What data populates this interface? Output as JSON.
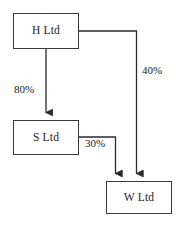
{
  "diagram": {
    "type": "flow-diagram",
    "colors": {
      "background": "#fefefe",
      "node_fill": "#ffffff",
      "node_border": "#3a3a3a",
      "edge": "#2b2b2b",
      "text": "#1c1c1c"
    },
    "nodes": [
      {
        "id": "h",
        "label": "H Ltd"
      },
      {
        "id": "s",
        "label": "S Ltd"
      },
      {
        "id": "w",
        "label": "W Ltd"
      }
    ],
    "edges": [
      {
        "id": "h-s",
        "from": "H Ltd",
        "to": "S Ltd",
        "label": "80%",
        "arrow": "down"
      },
      {
        "id": "s-w",
        "from": "S Ltd",
        "to": "W Ltd",
        "label": "30%",
        "arrow": "down"
      },
      {
        "id": "h-w",
        "from": "H Ltd",
        "to": "W Ltd",
        "label": "40%",
        "arrow": "down"
      }
    ]
  }
}
